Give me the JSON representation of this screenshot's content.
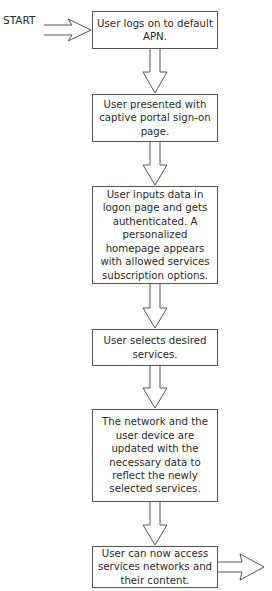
{
  "diagram": {
    "type": "flowchart",
    "start_label": "START",
    "steps": [
      {
        "id": 1,
        "text": "User logs on to default APN."
      },
      {
        "id": 2,
        "text": "User presented with captive portal sign-on page."
      },
      {
        "id": 3,
        "text": "User inputs data in logon page and gets authenticated. A personalized homepage appears with allowed services subscription options."
      },
      {
        "id": 4,
        "text": "User selects desired services."
      },
      {
        "id": 5,
        "text": "The network and the user device are updated with the necessary data to reflect the newly selected services."
      },
      {
        "id": 6,
        "text": "User can now access services networks and their content."
      }
    ],
    "edges": [
      {
        "from": "START",
        "to": 1
      },
      {
        "from": 1,
        "to": 2
      },
      {
        "from": 2,
        "to": 3
      },
      {
        "from": 3,
        "to": 4
      },
      {
        "from": 4,
        "to": 5
      },
      {
        "from": 5,
        "to": 6
      },
      {
        "from": 6,
        "to": "exit"
      }
    ]
  }
}
